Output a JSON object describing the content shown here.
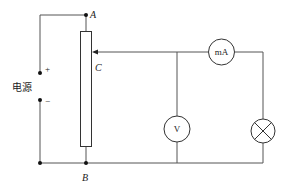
{
  "diagram": {
    "type": "circuit",
    "labels": {
      "node_a": "A",
      "node_b": "B",
      "slider_c": "C",
      "power_source": "电源",
      "plus": "+",
      "minus": "−"
    },
    "components": {
      "ammeter": "mA",
      "voltmeter": "V",
      "lamp": "lamp",
      "rheostat": "sliding rheostat"
    },
    "colors": {
      "wire": "#555555",
      "component_stroke": "#333333"
    }
  }
}
